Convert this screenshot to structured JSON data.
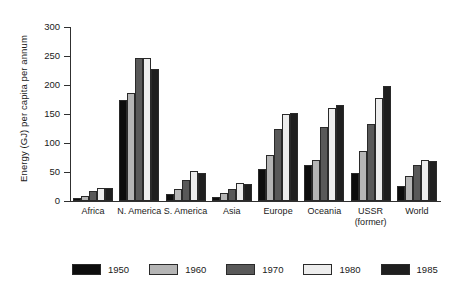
{
  "chart_data": {
    "type": "bar",
    "title": "",
    "subtitle": "",
    "xlabel": "",
    "ylabel": "Energy (GJ) per capita per annum",
    "ylim": [
      0,
      300
    ],
    "ytick_values": [
      0,
      50,
      100,
      150,
      200,
      250,
      300
    ],
    "ytick_labels": [
      "0",
      "50",
      "100",
      "150",
      "200",
      "250",
      "300"
    ],
    "grid": false,
    "legend_position": "bottom",
    "categories": [
      "Africa",
      "N. America",
      "S. America",
      "Asia",
      "Europe",
      "Oceania",
      "USSR (former)",
      "World"
    ],
    "category_labels": [
      {
        "line1": "Africa",
        "line2": ""
      },
      {
        "line1": "N. America",
        "line2": ""
      },
      {
        "line1": "S. America",
        "line2": ""
      },
      {
        "line1": "Asia",
        "line2": ""
      },
      {
        "line1": "Europe",
        "line2": ""
      },
      {
        "line1": "Oceania",
        "line2": ""
      },
      {
        "line1": "USSR",
        "line2": "(former)"
      },
      {
        "line1": "World",
        "line2": ""
      }
    ],
    "series": [
      {
        "name": "1950",
        "color": "#0d0d0d",
        "values": [
          6,
          174,
          12,
          7,
          56,
          62,
          48,
          26
        ]
      },
      {
        "name": "1960",
        "color": "#b5b5b5",
        "values": [
          9,
          186,
          20,
          13,
          80,
          71,
          86,
          43
        ]
      },
      {
        "name": "1970",
        "color": "#595959",
        "values": [
          17,
          246,
          36,
          21,
          124,
          127,
          133,
          62
        ]
      },
      {
        "name": "1980",
        "color": "#ededed",
        "values": [
          22,
          246,
          52,
          31,
          150,
          160,
          177,
          70
        ]
      },
      {
        "name": "1985",
        "color": "#1f1f1f",
        "values": [
          22,
          228,
          49,
          30,
          151,
          165,
          199,
          69
        ]
      }
    ],
    "legend": [
      {
        "label": "1950",
        "color": "#0d0d0d"
      },
      {
        "label": "1960",
        "color": "#b5b5b5"
      },
      {
        "label": "1970",
        "color": "#595959"
      },
      {
        "label": "1980",
        "color": "#ededed"
      },
      {
        "label": "1985",
        "color": "#1f1f1f"
      }
    ],
    "colors": {
      "axis": "#303030",
      "text": "#1a1a1a",
      "background": "#ffffff",
      "bar_outline": "#2a2a2a"
    }
  }
}
